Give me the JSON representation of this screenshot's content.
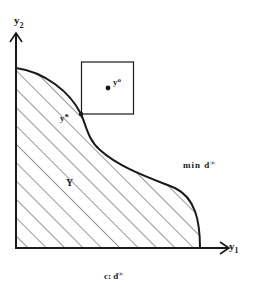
{
  "diagram": {
    "axes": {
      "y_axis_label": "y",
      "y_axis_subscript": "2",
      "x_axis_label": "y",
      "x_axis_subscript": "1"
    },
    "region_label": "Y",
    "point_star": {
      "label": "y",
      "superscript": "*"
    },
    "point_ideal": {
      "label": "y",
      "superscript": "o"
    },
    "annotation_right": {
      "text": "min d",
      "superscript": "∞"
    },
    "caption": {
      "text": "c: d",
      "superscript": "∞"
    },
    "colors": {
      "ink": "#1a1a1a",
      "background": "#ffffff"
    }
  }
}
